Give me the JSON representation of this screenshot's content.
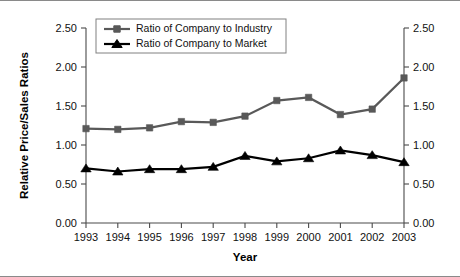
{
  "chart_data": {
    "type": "line",
    "title": "",
    "xlabel": "Year",
    "ylabel": "Relative Price/Sales Ratios",
    "ylabel_right": "",
    "categories": [
      "1993",
      "1994",
      "1995",
      "1996",
      "1997",
      "1998",
      "1999",
      "2000",
      "2001",
      "2002",
      "2003"
    ],
    "x": [
      1993,
      1994,
      1995,
      1996,
      1997,
      1998,
      1999,
      2000,
      2001,
      2002,
      2003
    ],
    "ylim": [
      0.0,
      2.5
    ],
    "ytick_labels": [
      "0.00",
      "0.50",
      "1.00",
      "1.50",
      "2.00",
      "2.50"
    ],
    "ytick_values": [
      0.0,
      0.5,
      1.0,
      1.5,
      2.0,
      2.5
    ],
    "ytick_labels_right": [
      "0.00",
      "0.50",
      "1.00",
      "1.50",
      "2.00",
      "2.50"
    ],
    "grid": false,
    "legend_position": "top-left-inside",
    "series": [
      {
        "name": "Ratio of Company to Industry",
        "color": "#595959",
        "marker": "square",
        "values": [
          1.21,
          1.2,
          1.22,
          1.3,
          1.29,
          1.37,
          1.57,
          1.61,
          1.39,
          1.46,
          1.86
        ]
      },
      {
        "name": "Ratio of Company to Market",
        "color": "#000000",
        "marker": "triangle",
        "values": [
          0.7,
          0.66,
          0.69,
          0.69,
          0.72,
          0.86,
          0.79,
          0.83,
          0.93,
          0.87,
          0.78
        ]
      }
    ]
  },
  "legend": {
    "entries": [
      {
        "label": "Ratio of Company to Industry"
      },
      {
        "label": "Ratio of Company to Market"
      }
    ]
  },
  "axes": {
    "x_title": "Year",
    "y_title": "Relative Price/Sales Ratios"
  }
}
